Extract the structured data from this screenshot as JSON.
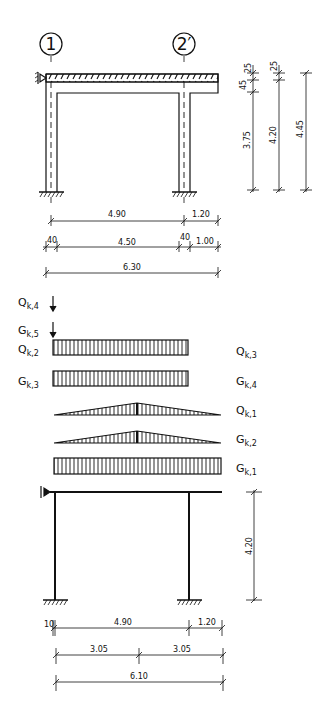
{
  "top_frame": {
    "axes": [
      {
        "label": "1",
        "x": 51
      },
      {
        "label": "2′",
        "x": 184
      }
    ],
    "horizontal_dims": [
      {
        "row": 1,
        "segments": [
          {
            "label": "4.90",
            "from": 51,
            "to": 184
          },
          {
            "label": "1.20",
            "from": 184,
            "to": 218
          }
        ]
      },
      {
        "row": 2,
        "segments": [
          {
            "label": "40",
            "from": 46,
            "to": 57
          },
          {
            "label": "4.50",
            "from": 57,
            "to": 179
          },
          {
            "label": "40",
            "from": 179,
            "to": 190
          },
          {
            "label": "1.00",
            "from": 190,
            "to": 218
          }
        ]
      },
      {
        "row": 3,
        "segments": [
          {
            "label": "6.30",
            "from": 46,
            "to": 218
          }
        ]
      }
    ],
    "vertical_dims": [
      {
        "labels": [
          "25",
          "45",
          "3.75"
        ]
      },
      {
        "labels": [
          "25",
          "4.20"
        ]
      },
      {
        "labels": [
          "4.45"
        ]
      }
    ]
  },
  "loads": {
    "left": [
      {
        "symbol": "Q",
        "sub": "k,4",
        "type": "point"
      },
      {
        "symbol": "G",
        "sub": "k,5",
        "type": "point"
      },
      {
        "symbol": "Q",
        "sub": "k,2",
        "type": "uniform"
      },
      {
        "symbol": "G",
        "sub": "k,3",
        "type": "uniform"
      }
    ],
    "right": [
      {
        "symbol": "Q",
        "sub": "k,3"
      },
      {
        "symbol": "G",
        "sub": "k,4"
      },
      {
        "symbol": "Q",
        "sub": "k,1",
        "type": "triangular"
      },
      {
        "symbol": "G",
        "sub": "k,2",
        "type": "triangular"
      },
      {
        "symbol": "G",
        "sub": "k,1",
        "type": "uniform"
      }
    ]
  },
  "bottom_frame": {
    "vertical_dim": "4.20",
    "horizontal_dims": [
      {
        "row": 1,
        "segments": [
          {
            "label": "10"
          },
          {
            "label": "4.90"
          },
          {
            "label": "1.20"
          }
        ]
      },
      {
        "row": 2,
        "segments": [
          {
            "label": "3.05"
          },
          {
            "label": "3.05"
          }
        ]
      },
      {
        "row": 3,
        "segments": [
          {
            "label": "6.10"
          }
        ]
      }
    ]
  }
}
